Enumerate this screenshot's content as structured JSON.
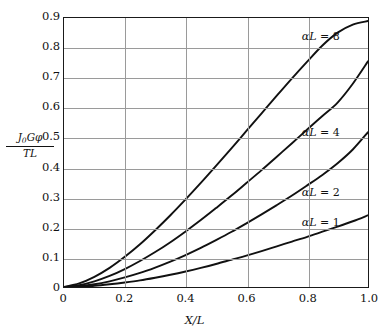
{
  "chart_data": {
    "type": "line",
    "title": "",
    "xlabel": "X/L",
    "ylabel_numerator": "J0Gφ",
    "ylabel_denominator": "TL",
    "grid": true,
    "legend_position": "inline-right",
    "xlim": [
      0,
      1.0
    ],
    "ylim": [
      0,
      0.9
    ],
    "xticks": [
      "0",
      "0.2",
      "0.4",
      "0.6",
      "0.8",
      "1.0"
    ],
    "xtick_values": [
      0,
      0.2,
      0.4,
      0.6,
      0.8,
      1.0
    ],
    "yticks": [
      "0",
      "0.1",
      "0.2",
      "0.3",
      "0.4",
      "0.5",
      "0.6",
      "0.7",
      "0.8",
      "0.9"
    ],
    "ytick_values": [
      0,
      0.1,
      0.2,
      0.3,
      0.4,
      0.5,
      0.6,
      0.7,
      0.8,
      0.9
    ],
    "x": [
      0,
      0.05,
      0.1,
      0.15,
      0.2,
      0.25,
      0.3,
      0.35,
      0.4,
      0.45,
      0.5,
      0.55,
      0.6,
      0.65,
      0.7,
      0.75,
      0.8,
      0.85,
      0.9,
      0.95,
      1.0
    ],
    "series": [
      {
        "name": "αL = 8",
        "alpha_L": 8,
        "color": "#111111",
        "label_x": 0.78,
        "label_y": 0.855,
        "values": [
          0,
          0.012,
          0.034,
          0.064,
          0.101,
          0.143,
          0.19,
          0.24,
          0.293,
          0.348,
          0.405,
          0.463,
          0.522,
          0.581,
          0.64,
          0.698,
          0.754,
          0.808,
          0.851,
          0.878,
          0.89
        ]
      },
      {
        "name": "αL = 4",
        "alpha_L": 4,
        "color": "#111111",
        "label_x": 0.78,
        "label_y": 0.535,
        "values": [
          0,
          0.006,
          0.019,
          0.037,
          0.06,
          0.087,
          0.117,
          0.15,
          0.186,
          0.224,
          0.264,
          0.305,
          0.348,
          0.391,
          0.436,
          0.481,
          0.527,
          0.572,
          0.617,
          0.68,
          0.755
        ]
      },
      {
        "name": "αL = 2",
        "alpha_L": 2,
        "color": "#111111",
        "label_x": 0.78,
        "label_y": 0.335,
        "values": [
          0,
          0.003,
          0.009,
          0.019,
          0.032,
          0.047,
          0.065,
          0.085,
          0.107,
          0.131,
          0.157,
          0.184,
          0.213,
          0.243,
          0.274,
          0.306,
          0.34,
          0.375,
          0.414,
          0.46,
          0.518
        ]
      },
      {
        "name": "αL = 1",
        "alpha_L": 1,
        "color": "#111111",
        "label_x": 0.78,
        "label_y": 0.235,
        "values": [
          0,
          0.001,
          0.004,
          0.009,
          0.015,
          0.022,
          0.031,
          0.041,
          0.052,
          0.064,
          0.077,
          0.091,
          0.105,
          0.12,
          0.136,
          0.152,
          0.168,
          0.185,
          0.202,
          0.22,
          0.24
        ]
      }
    ],
    "colors": {
      "axis": "#1a1a1a",
      "grid": "#9a9a9a",
      "curve": "#111111",
      "background": "#ffffff",
      "text": "#111111"
    }
  }
}
